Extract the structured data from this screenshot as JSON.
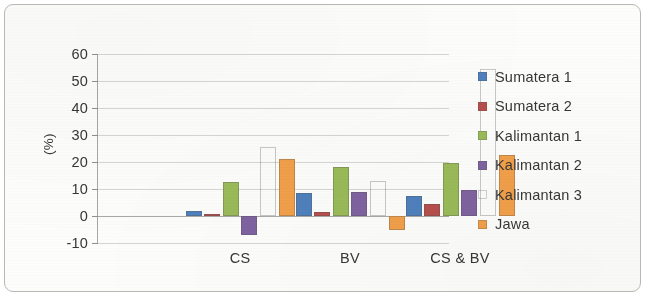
{
  "chart_data": {
    "type": "bar",
    "title": "",
    "subtitle": "",
    "xlabel": "",
    "ylabel": "(%)",
    "categories": [
      "CS",
      "BV",
      "CS & BV"
    ],
    "series": [
      {
        "name": "Sumatera 1",
        "color": "#4f81bd",
        "values": [
          2.0,
          8.5,
          7.5
        ]
      },
      {
        "name": "Sumatera 2",
        "color": "#b8504d",
        "values": [
          0.8,
          1.5,
          4.5
        ]
      },
      {
        "name": "Kalimantan 1",
        "color": "#9bbb59",
        "values": [
          12.5,
          18.0,
          19.5
        ]
      },
      {
        "name": "Kalimantan 2",
        "color": "#7f63a1",
        "values": [
          -7.0,
          9.0,
          9.5
        ]
      },
      {
        "name": "Kalimantan 3",
        "color": "#5cб0d0",
        "values": [
          25.5,
          13.0,
          54.5
        ]
      },
      {
        "name": "Jawa",
        "color": "#f2a04a",
        "values": [
          21.0,
          -5.0,
          22.5
        ]
      }
    ],
    "yticks": [
      60,
      50,
      40,
      30,
      20,
      10,
      0,
      -10
    ],
    "ylim": [
      -10,
      60
    ],
    "grid": true,
    "legend_position": "right"
  },
  "legend": {
    "entries": [
      {
        "label": "Sumatera 1"
      },
      {
        "label": "Sumatera 2"
      },
      {
        "label": "Kalimantan 1"
      },
      {
        "label": "Kalimantan 2"
      },
      {
        "label": "Kalimantan 3"
      },
      {
        "label": "Jawa"
      }
    ]
  }
}
